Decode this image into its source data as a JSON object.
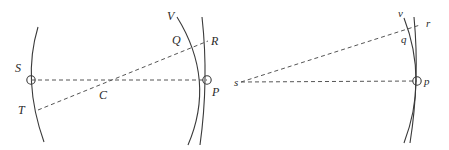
{
  "figure": {
    "background_color": "#ffffff",
    "stroke_color": "#3a3a3a",
    "dash_color": "#555555",
    "label_color": "#2a2a2a"
  },
  "left_diagram": {
    "name": "large-scale-construction",
    "labels": {
      "S": "S",
      "T": "T",
      "C": "C",
      "P": "P",
      "Q": "Q",
      "R": "R",
      "V": "V"
    },
    "points": {
      "S": {
        "x": 31,
        "y": 80,
        "marker": "circle"
      },
      "C": {
        "x": 105,
        "y": 82,
        "marker": "none"
      },
      "P": {
        "x": 207,
        "y": 80,
        "marker": "circle"
      },
      "Q": {
        "x": 184,
        "y": 44,
        "marker": "none"
      },
      "R": {
        "x": 205,
        "y": 41,
        "marker": "none"
      },
      "T": {
        "x": 38,
        "y": 110,
        "marker": "none"
      },
      "V": {
        "x": 172,
        "y": 20,
        "marker": "none"
      }
    },
    "label_positions": {
      "S": {
        "x": 15,
        "y": 62
      },
      "T": {
        "x": 18,
        "y": 104
      },
      "C": {
        "x": 99,
        "y": 89
      },
      "P": {
        "x": 212,
        "y": 86
      },
      "Q": {
        "x": 172,
        "y": 34
      },
      "R": {
        "x": 211,
        "y": 35
      },
      "V": {
        "x": 167,
        "y": 10
      }
    },
    "elements": [
      {
        "name": "left-arc",
        "type": "arc",
        "note": "arc through S, convex to the left"
      },
      {
        "name": "right-arc-V",
        "type": "arc",
        "note": "arc through Q and P labelled V, convex to the right"
      },
      {
        "name": "vertical-line-RP",
        "type": "line",
        "note": "near vertical line through R and P"
      },
      {
        "name": "dashed-line-SP",
        "type": "dashed",
        "note": "horizontal dashed line from S through C to P"
      },
      {
        "name": "dashed-line-TQ",
        "type": "dashed",
        "note": "dashed line from T through C to Q and R"
      }
    ]
  },
  "right_diagram": {
    "name": "small-scale-construction",
    "labels": {
      "s": "s",
      "p": "p",
      "q": "q",
      "r": "r",
      "v": "v"
    },
    "points": {
      "s": {
        "x": 240,
        "y": 82,
        "marker": "none"
      },
      "p": {
        "x": 417,
        "y": 81,
        "marker": "circle"
      },
      "q": {
        "x": 406,
        "y": 38,
        "marker": "none"
      },
      "r": {
        "x": 418,
        "y": 27,
        "marker": "none"
      },
      "v": {
        "x": 402,
        "y": 16,
        "marker": "none"
      }
    },
    "label_positions": {
      "s": {
        "x": 234,
        "y": 77
      },
      "p": {
        "x": 424,
        "y": 76
      },
      "q": {
        "x": 401,
        "y": 34
      },
      "r": {
        "x": 426,
        "y": 18
      },
      "v": {
        "x": 398,
        "y": 8
      }
    },
    "elements": [
      {
        "name": "arc-v",
        "type": "arc",
        "note": "arc through q and p labelled v, convex to the right"
      },
      {
        "name": "vertical-line-rp",
        "type": "line",
        "note": "near vertical line through r and p"
      },
      {
        "name": "dashed-line-sp",
        "type": "dashed",
        "note": "horizontal dashed line from s to p"
      },
      {
        "name": "dashed-line-sr",
        "type": "dashed",
        "note": "dashed line from s up to q and r"
      }
    ]
  }
}
